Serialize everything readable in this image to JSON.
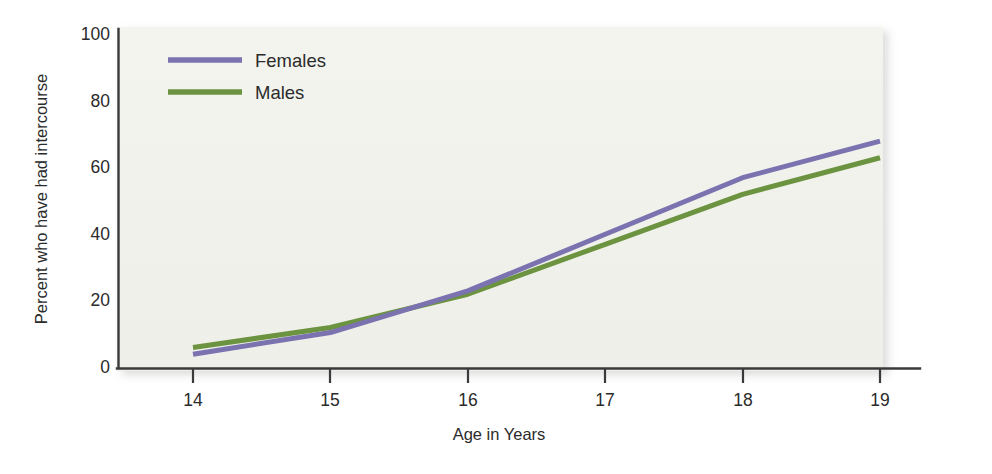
{
  "figure": {
    "title": "",
    "panel_bg": "#f2f2ed",
    "axis_color": "#3a3a3a"
  },
  "legend": {
    "position": "top-left-inside",
    "entries": [
      {
        "label": "Females",
        "color": "#7b73b0",
        "swatch_name": "legend-swatch-females"
      },
      {
        "label": "Males",
        "color": "#6b9340",
        "swatch_name": "legend-swatch-males"
      }
    ]
  },
  "yaxis": {
    "title": "Percent who have had intercourse",
    "ticks": [
      "0",
      "20",
      "40",
      "60",
      "80",
      "100"
    ],
    "min": 0,
    "max": 100
  },
  "xaxis": {
    "title": "Age in Years",
    "ticks": [
      "14",
      "15",
      "16",
      "17",
      "18",
      "19"
    ],
    "min": 14,
    "max": 19
  },
  "chart_data": {
    "type": "line",
    "title": "",
    "subtitle": "",
    "xlabel": "Age in Years",
    "ylabel": "Percent who have had intercourse",
    "x": [
      14,
      15,
      16,
      17,
      18,
      19
    ],
    "categories": [
      "14",
      "15",
      "16",
      "17",
      "18",
      "19"
    ],
    "series": [
      {
        "name": "Females",
        "color": "#7b73b0",
        "values": [
          4,
          10.5,
          23,
          40,
          57,
          68
        ]
      },
      {
        "name": "Males",
        "color": "#6b9340",
        "values": [
          6,
          12,
          22,
          37,
          52,
          63
        ]
      }
    ],
    "xlim": [
      14,
      19
    ],
    "ylim": [
      0,
      100
    ],
    "ytick_values": [
      0,
      20,
      40,
      60,
      80,
      100
    ],
    "xtick_values": [
      14,
      15,
      16,
      17,
      18,
      19
    ],
    "grid": false,
    "legend_position": "upper left"
  }
}
